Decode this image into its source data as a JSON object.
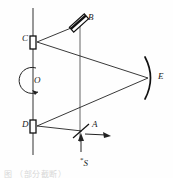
{
  "figure": {
    "kind": "optical-ray-diagram",
    "background_color": "#fefefe",
    "stroke_color": "#1a1a1a",
    "width": 173,
    "height": 178
  },
  "labels": {
    "C": "C",
    "D": "D",
    "B": "B",
    "A": "A",
    "E": "E",
    "O": "O",
    "S_star": "*",
    "S": "S"
  },
  "components": {
    "rotating_axis": {
      "name": "vertical rotation axis",
      "x": 33,
      "y_top": 8,
      "y_bottom": 155
    },
    "secondary_axis": {
      "name": "vertical line through B and A",
      "x": 80,
      "y_top": 24,
      "y_bottom": 142
    },
    "mirror_C": {
      "name": "mirror C",
      "shape": "small-vertical-rectangle",
      "x": 30,
      "y": 36,
      "w": 6,
      "h": 13
    },
    "mirror_D": {
      "name": "mirror D",
      "shape": "small-vertical-rectangle",
      "x": 30,
      "y": 120,
      "w": 6,
      "h": 13
    },
    "mirror_B": {
      "name": "tilted mirror B",
      "shape": "tilted-rectangle",
      "cx": 79,
      "cy": 23,
      "length": 20,
      "thickness": 6,
      "angle_deg": -42
    },
    "mirror_E": {
      "name": "concave mirror E",
      "shape": "arc",
      "cx": 150,
      "cy": 78,
      "radius": 22
    },
    "beam_splitter_A": {
      "name": "beam splitter A",
      "shape": "tilted-line",
      "cx": 81,
      "cy": 131,
      "length": 20,
      "angle_deg": 42
    },
    "rotation_arrow_O": {
      "name": "rotation direction arrow around O",
      "cx": 33,
      "cy": 80,
      "radius": 13
    },
    "source_arrow_S": {
      "name": "incoming beam from source S",
      "x": 81,
      "y_from": 152,
      "y_to": 136
    },
    "output_arrow": {
      "name": "outgoing observation beam",
      "x_from": 86,
      "x_to": 110,
      "y": 134
    }
  },
  "rays": [
    {
      "name": "ray-C-to-E",
      "x1": 37,
      "y1": 42,
      "x2": 148,
      "y2": 78
    },
    {
      "name": "ray-E-to-D",
      "x1": 148,
      "y1": 78,
      "x2": 37,
      "y2": 126
    },
    {
      "name": "ray-C-to-B",
      "x1": 37,
      "y1": 42,
      "x2": 76,
      "y2": 26
    },
    {
      "name": "ray-D-to-A",
      "x1": 37,
      "y1": 126,
      "x2": 80,
      "y2": 131
    }
  ],
  "caption": {
    "text": "图                  （部分截断）"
  }
}
